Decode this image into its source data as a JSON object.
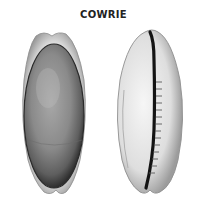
{
  "title": "COWRIE",
  "figures": [
    {
      "name": "cowrie-dorsal-view",
      "description": "Cowrie shell, top (dorsal) view, dark grey domed back"
    },
    {
      "name": "cowrie-ventral-view",
      "description": "Cowrie shell, underside (ventral) view with toothed aperture"
    }
  ],
  "colors": {
    "background": "#ffffff",
    "shell_light": "#e8e8e8",
    "shell_dark": "#6a6a6a",
    "aperture": "#1a1a1a"
  }
}
